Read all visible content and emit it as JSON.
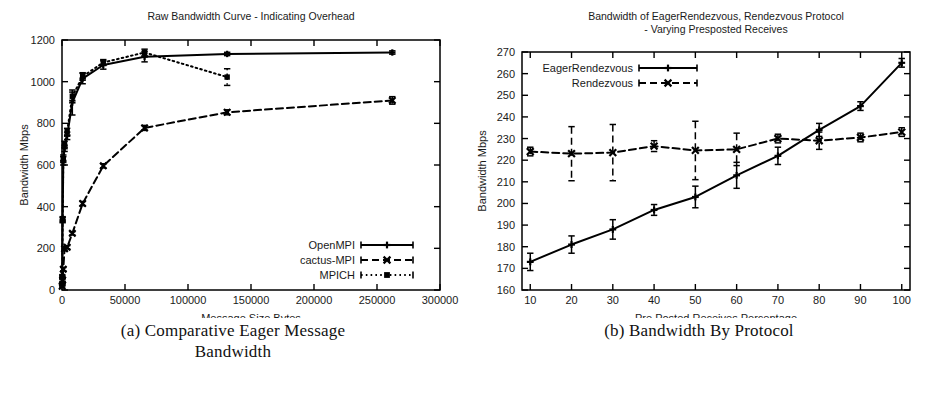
{
  "figure": {
    "panels": [
      {
        "id": "panel-a",
        "caption_lines": [
          "(a) Comparative Eager Message",
          "Bandwidth"
        ],
        "chart_data": {
          "type": "line",
          "title": "Raw Bandwidth Curve - Indicating Overhead",
          "xlabel": "Message Size Bytes",
          "ylabel": "Bandwidth Mbps",
          "xlim": [
            0,
            300000
          ],
          "ylim": [
            0,
            1200
          ],
          "xticks": [
            0,
            50000,
            100000,
            150000,
            200000,
            250000,
            300000
          ],
          "xtick_labels": [
            "0",
            "50000",
            "100000",
            "150000",
            "200000",
            "250000",
            "300000"
          ],
          "yticks": [
            0,
            200,
            400,
            600,
            800,
            1000,
            1200
          ],
          "ytick_labels": [
            "0",
            "200",
            "400",
            "600",
            "800",
            "1000",
            "1200"
          ],
          "grid": false,
          "legend_position": "bottom-right",
          "series": [
            {
              "name": "OpenMPI",
              "style": "solid",
              "marker": "plus",
              "color": "#000000",
              "x": [
                128,
                256,
                512,
                1024,
                2048,
                4096,
                8192,
                16384,
                32768,
                65536,
                131072,
                262144
              ],
              "y": [
                25,
                60,
                335,
                620,
                680,
                740,
                900,
                1015,
                1080,
                1120,
                1133,
                1140
              ],
              "yerr": [
                5,
                8,
                12,
                20,
                15,
                18,
                60,
                25,
                20,
                25,
                8,
                8
              ]
            },
            {
              "name": "cactus-MPI",
              "style": "dashed",
              "marker": "cross",
              "color": "#000000",
              "x": [
                128,
                512,
                1024,
                2048,
                4096,
                8192,
                16384,
                32768,
                65536,
                131072,
                262144
              ],
              "y": [
                18,
                48,
                100,
                198,
                205,
                272,
                415,
                596,
                778,
                853,
                910
              ],
              "yerr": [
                4,
                6,
                8,
                10,
                8,
                8,
                10,
                10,
                12,
                12,
                18
              ]
            },
            {
              "name": "MPICH",
              "style": "dotted",
              "marker": "square",
              "color": "#000000",
              "x": [
                128,
                256,
                512,
                1024,
                2048,
                4096,
                8192,
                16384,
                32768,
                65536,
                131072
              ],
              "y": [
                30,
                65,
                340,
                630,
                700,
                760,
                930,
                1025,
                1092,
                1140,
                1022
              ],
              "yerr": [
                5,
                8,
                12,
                18,
                14,
                16,
                20,
                18,
                14,
                16,
                40
              ]
            }
          ]
        }
      },
      {
        "id": "panel-b",
        "caption_lines": [
          "(b) Bandwidth By Protocol"
        ],
        "chart_data": {
          "type": "line",
          "title": "Bandwidth of EagerRendezvous, Rendezvous Protocol",
          "subtitle": "- Varying Presposted Receives",
          "xlabel": "Pre Posted Receives Percentage",
          "ylabel": "Bandwidth Mbps",
          "xlim": [
            8,
            102
          ],
          "ylim": [
            160,
            270
          ],
          "xticks": [
            10,
            20,
            30,
            40,
            50,
            60,
            70,
            80,
            90,
            100
          ],
          "xtick_labels": [
            "10",
            "20",
            "30",
            "40",
            "50",
            "60",
            "70",
            "80",
            "90",
            "100"
          ],
          "yticks": [
            160,
            170,
            180,
            190,
            200,
            210,
            220,
            230,
            240,
            250,
            260,
            270
          ],
          "ytick_labels": [
            "160",
            "170",
            "180",
            "190",
            "200",
            "210",
            "220",
            "230",
            "240",
            "250",
            "260",
            "270"
          ],
          "grid": false,
          "legend_position": "top-left",
          "categories": [
            10,
            20,
            30,
            40,
            50,
            60,
            70,
            80,
            90,
            100
          ],
          "series": [
            {
              "name": "EagerRendezvous",
              "style": "solid",
              "marker": "plus",
              "color": "#000000",
              "x": [
                10,
                20,
                30,
                40,
                50,
                60,
                70,
                80,
                90,
                100
              ],
              "y": [
                173,
                181,
                188,
                197,
                203,
                213,
                222,
                234,
                245,
                265
              ],
              "yerr": [
                4,
                4,
                4.5,
                2.5,
                5,
                6,
                4,
                3,
                2,
                2
              ]
            },
            {
              "name": "Rendezvous",
              "style": "dashed",
              "marker": "cross",
              "color": "#000000",
              "x": [
                10,
                20,
                30,
                40,
                50,
                60,
                70,
                80,
                90,
                100
              ],
              "y": [
                224,
                223,
                223.5,
                226.5,
                224.5,
                225,
                230,
                229,
                230.5,
                233
              ],
              "yerr": [
                2,
                12.5,
                13,
                2.5,
                13.5,
                7.5,
                2,
                4,
                2,
                2
              ]
            }
          ]
        }
      }
    ]
  }
}
